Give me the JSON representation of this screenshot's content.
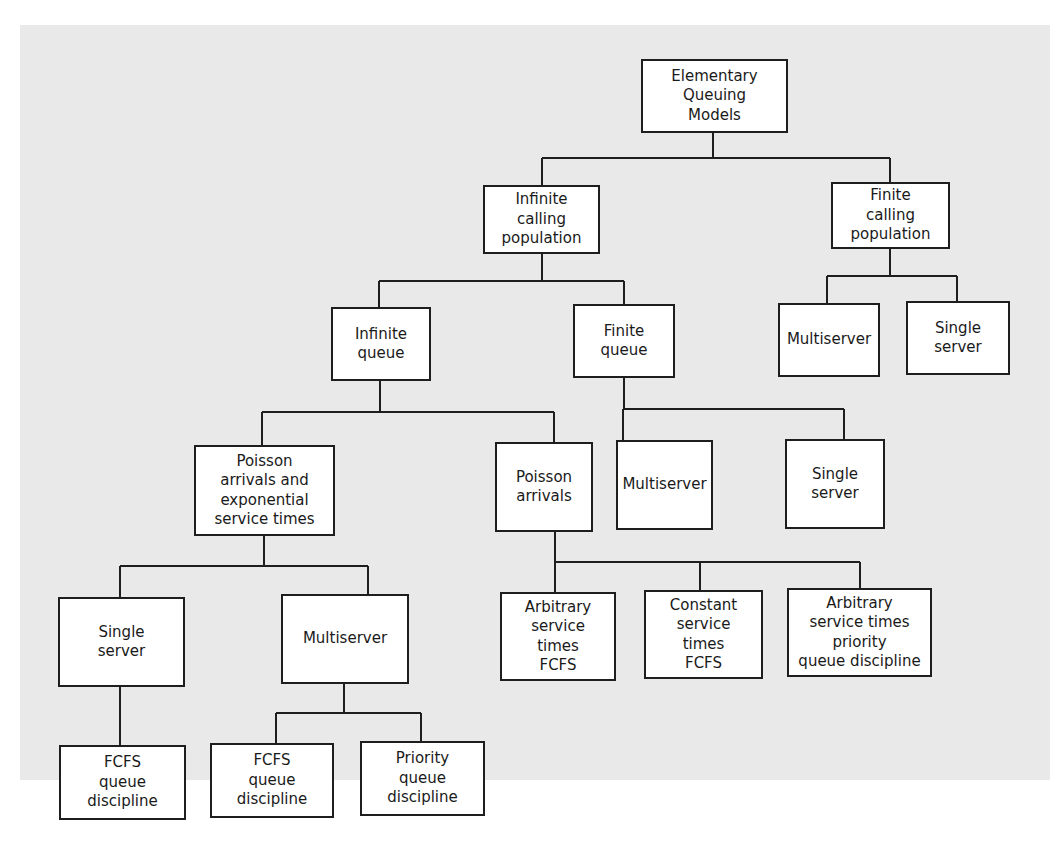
{
  "diagram": {
    "type": "tree",
    "colors": {
      "background": "#ffffff",
      "panel": "#e9e9e9",
      "node_fill": "#ffffff",
      "stroke": "#1e1e1e",
      "text": "#1a1a1a"
    },
    "nodes": {
      "root": {
        "label": "Elementary\nQueuing\nModels"
      },
      "infinite_calling_population": {
        "label": "Infinite\ncalling\npopulation"
      },
      "finite_calling_population": {
        "label": "Finite\ncalling\npopulation"
      },
      "infinite_queue": {
        "label": "Infinite\nqueue"
      },
      "finite_queue": {
        "label": "Finite\nqueue"
      },
      "fcp_multiserver": {
        "label": "Multiserver"
      },
      "fcp_single_server": {
        "label": "Single\nserver"
      },
      "poisson_exponential": {
        "label": "Poisson\narrivals and\nexponential\nservice times"
      },
      "poisson_arrivals": {
        "label": "Poisson\narrivals"
      },
      "fq_multiserver": {
        "label": "Multiserver"
      },
      "fq_single_server": {
        "label": "Single\nserver"
      },
      "pe_single_server": {
        "label": "Single\nserver"
      },
      "pe_multiserver": {
        "label": "Multiserver"
      },
      "arbitrary_fcfs": {
        "label": "Arbitrary\nservice\ntimes\nFCFS"
      },
      "constant_fcfs": {
        "label": "Constant\nservice\ntimes\nFCFS"
      },
      "arbitrary_priority": {
        "label": "Arbitrary\nservice times\npriority\nqueue discipline"
      },
      "ss_fcfs": {
        "label": "FCFS\nqueue\ndiscipline"
      },
      "ms_fcfs": {
        "label": "FCFS\nqueue\ndiscipline"
      },
      "ms_priority": {
        "label": "Priority\nqueue\ndiscipline"
      }
    },
    "edges": [
      [
        "root",
        "infinite_calling_population"
      ],
      [
        "root",
        "finite_calling_population"
      ],
      [
        "infinite_calling_population",
        "infinite_queue"
      ],
      [
        "infinite_calling_population",
        "finite_queue"
      ],
      [
        "finite_calling_population",
        "fcp_multiserver"
      ],
      [
        "finite_calling_population",
        "fcp_single_server"
      ],
      [
        "infinite_queue",
        "poisson_exponential"
      ],
      [
        "infinite_queue",
        "poisson_arrivals"
      ],
      [
        "finite_queue",
        "fq_multiserver"
      ],
      [
        "finite_queue",
        "fq_single_server"
      ],
      [
        "poisson_exponential",
        "pe_single_server"
      ],
      [
        "poisson_exponential",
        "pe_multiserver"
      ],
      [
        "poisson_arrivals",
        "arbitrary_fcfs"
      ],
      [
        "poisson_arrivals",
        "constant_fcfs"
      ],
      [
        "poisson_arrivals",
        "arbitrary_priority"
      ],
      [
        "pe_single_server",
        "ss_fcfs"
      ],
      [
        "pe_multiserver",
        "ms_fcfs"
      ],
      [
        "pe_multiserver",
        "ms_priority"
      ]
    ]
  }
}
